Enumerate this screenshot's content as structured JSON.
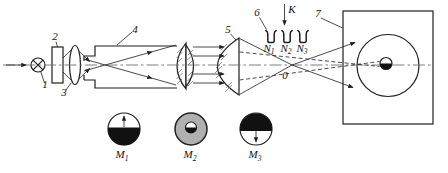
{
  "figure": {
    "type": "optical-schematic-diagram",
    "colors": {
      "ink": "#1f1f1f",
      "axis": "#6f6f6f",
      "disk_gray": "#b0b0b0"
    },
    "labels": {
      "part1": "1",
      "part2": "2",
      "part3": "3",
      "part4": "4",
      "part5": "5",
      "part6": "6",
      "part7": "7",
      "k": "K",
      "focus": "0"
    },
    "samples": {
      "s1": {
        "base": "N",
        "sub": "1"
      },
      "s2": {
        "base": "N",
        "sub": "2"
      },
      "s3": {
        "base": "N",
        "sub": "3"
      }
    },
    "modes": {
      "m1": {
        "base": "M",
        "sub": "1"
      },
      "m2": {
        "base": "M",
        "sub": "2"
      },
      "m3": {
        "base": "M",
        "sub": "3"
      }
    }
  }
}
